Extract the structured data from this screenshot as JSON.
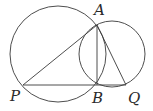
{
  "diagram": {
    "type": "geometry",
    "stroke_color": "#3a3a3a",
    "circles": [
      {
        "name": "large-circle",
        "cx": 58,
        "cy": 54,
        "r": 48
      },
      {
        "name": "small-circle",
        "cx": 112,
        "cy": 54,
        "r": 33
      }
    ],
    "points": {
      "A": {
        "label": "A",
        "x": 97,
        "y": 25,
        "lx": 94,
        "ly": 15
      },
      "P": {
        "label": "P",
        "x": 23,
        "y": 85,
        "lx": 10,
        "ly": 101
      },
      "B": {
        "label": "B",
        "x": 97,
        "y": 85,
        "lx": 92,
        "ly": 103
      },
      "Q": {
        "label": "Q",
        "x": 126,
        "y": 85,
        "lx": 128,
        "ly": 103
      }
    },
    "segments": [
      [
        "P",
        "A"
      ],
      [
        "A",
        "B"
      ],
      [
        "A",
        "Q"
      ],
      [
        "P",
        "Q"
      ]
    ]
  }
}
